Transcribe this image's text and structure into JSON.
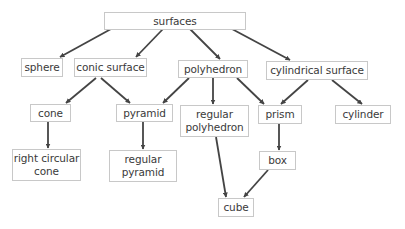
{
  "diagram": {
    "type": "hierarchy",
    "colors": {
      "box_border": "#c8c8c8",
      "arrow": "#444444",
      "text": "#3a3a3a",
      "background": "#ffffff"
    },
    "nodes": [
      {
        "id": "surfaces",
        "label": "surfaces",
        "x": 104,
        "y": 12,
        "w": 142,
        "h": 18
      },
      {
        "id": "sphere",
        "label": "sphere",
        "x": 21,
        "y": 58,
        "w": 42,
        "h": 19
      },
      {
        "id": "conic_surface",
        "label": "conic surface",
        "x": 74,
        "y": 58,
        "w": 73,
        "h": 19
      },
      {
        "id": "polyhedron",
        "label": "polyhedron",
        "x": 178,
        "y": 60,
        "w": 70,
        "h": 18
      },
      {
        "id": "cylindrical_surface",
        "label": "cylindrical surface",
        "x": 266,
        "y": 61,
        "w": 102,
        "h": 19
      },
      {
        "id": "cone",
        "label": "cone",
        "x": 30,
        "y": 104,
        "w": 41,
        "h": 18
      },
      {
        "id": "pyramid",
        "label": "pyramid",
        "x": 116,
        "y": 104,
        "w": 57,
        "h": 18
      },
      {
        "id": "regular_polyhedron",
        "label": "regular\npolyhedron",
        "x": 180,
        "y": 105,
        "w": 69,
        "h": 32
      },
      {
        "id": "prism",
        "label": "prism",
        "x": 258,
        "y": 105,
        "w": 44,
        "h": 19
      },
      {
        "id": "cylinder",
        "label": "cylinder",
        "x": 335,
        "y": 105,
        "w": 56,
        "h": 19
      },
      {
        "id": "right_circular_cone",
        "label": "right circular\ncone",
        "x": 12,
        "y": 149,
        "w": 69,
        "h": 32
      },
      {
        "id": "regular_pyramid",
        "label": "regular\npyramid",
        "x": 109,
        "y": 150,
        "w": 68,
        "h": 32
      },
      {
        "id": "box",
        "label": "box",
        "x": 259,
        "y": 151,
        "w": 37,
        "h": 19
      },
      {
        "id": "cube",
        "label": "cube",
        "x": 218,
        "y": 198,
        "w": 36,
        "h": 19
      }
    ],
    "edges": [
      {
        "from": "surfaces",
        "to": "sphere",
        "x1": 111,
        "y1": 29,
        "x2": 60,
        "y2": 57
      },
      {
        "from": "surfaces",
        "to": "conic_surface",
        "x1": 163,
        "y1": 29,
        "x2": 136,
        "y2": 57
      },
      {
        "from": "surfaces",
        "to": "polyhedron",
        "x1": 190,
        "y1": 29,
        "x2": 220,
        "y2": 59
      },
      {
        "from": "surfaces",
        "to": "cylindrical_surface",
        "x1": 232,
        "y1": 29,
        "x2": 290,
        "y2": 60
      },
      {
        "from": "conic_surface",
        "to": "cone",
        "x1": 96,
        "y1": 78,
        "x2": 66,
        "y2": 103
      },
      {
        "from": "conic_surface",
        "to": "pyramid",
        "x1": 101,
        "y1": 78,
        "x2": 130,
        "y2": 103
      },
      {
        "from": "polyhedron",
        "to": "pyramid",
        "x1": 189,
        "y1": 78,
        "x2": 163,
        "y2": 103
      },
      {
        "from": "polyhedron",
        "to": "regular_polyhedron",
        "x1": 213,
        "y1": 78,
        "x2": 213,
        "y2": 104
      },
      {
        "from": "polyhedron",
        "to": "prism",
        "x1": 237,
        "y1": 78,
        "x2": 264,
        "y2": 104
      },
      {
        "from": "cylindrical_surface",
        "to": "prism",
        "x1": 308,
        "y1": 80,
        "x2": 281,
        "y2": 104
      },
      {
        "from": "cylindrical_surface",
        "to": "cylinder",
        "x1": 332,
        "y1": 80,
        "x2": 362,
        "y2": 104
      },
      {
        "from": "cone",
        "to": "right_circular_cone",
        "x1": 48,
        "y1": 122,
        "x2": 48,
        "y2": 148
      },
      {
        "from": "pyramid",
        "to": "regular_pyramid",
        "x1": 143,
        "y1": 122,
        "x2": 143,
        "y2": 149
      },
      {
        "from": "regular_polyhedron",
        "to": "cube",
        "x1": 216,
        "y1": 137,
        "x2": 226,
        "y2": 197
      },
      {
        "from": "prism",
        "to": "box",
        "x1": 279,
        "y1": 124,
        "x2": 279,
        "y2": 150
      },
      {
        "from": "box",
        "to": "cube",
        "x1": 268,
        "y1": 170,
        "x2": 244,
        "y2": 197
      }
    ]
  }
}
